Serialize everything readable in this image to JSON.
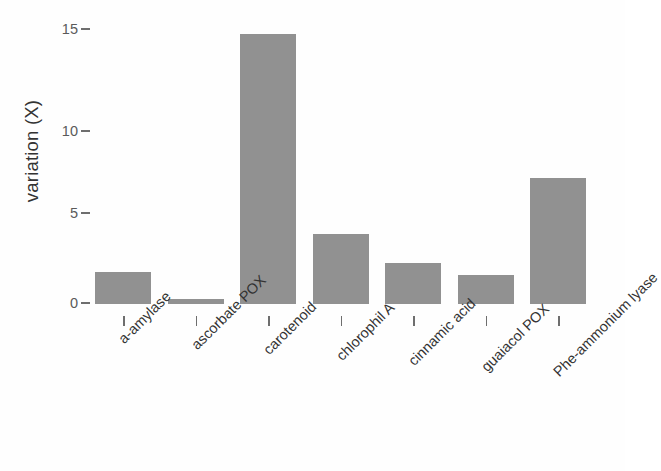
{
  "chart_data": {
    "type": "bar",
    "title": "",
    "subtitle": "",
    "xlabel": "",
    "ylabel": "variation (X)",
    "categories": [
      "a-amylase",
      "ascorbate POX",
      "carotenoid",
      "chlorophil A",
      "cinnamic acid",
      "guaiacol POX",
      "Phe-ammonium lyase"
    ],
    "values": [
      1.8,
      0.3,
      15.0,
      3.9,
      2.3,
      1.6,
      7.0
    ],
    "ylim": [
      0,
      15.8
    ],
    "yticks": [
      0,
      5,
      10,
      15
    ],
    "ytick_labels": [
      "0",
      "5",
      "10",
      "15"
    ],
    "grid": false,
    "legend": null,
    "legend_position": "none",
    "bar_color": "#919191",
    "axis_color": "#6e6e6e",
    "text_color": "#333333",
    "background_color": "#fefefe",
    "xtick_label_rotation": 45
  }
}
